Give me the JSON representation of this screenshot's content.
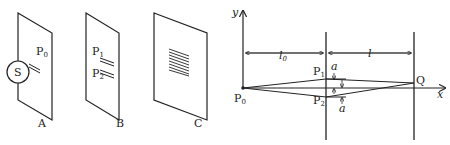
{
  "left_figure": {
    "screens": [
      {
        "id": "A",
        "label": "A",
        "slits": [
          {
            "label": "P",
            "sub": "0"
          }
        ],
        "source": "S"
      },
      {
        "id": "B",
        "label": "B",
        "slits": [
          {
            "label": "P",
            "sub": "1"
          },
          {
            "label": "P",
            "sub": "2"
          }
        ]
      },
      {
        "id": "C",
        "label": "C",
        "pattern": "interference fringes"
      }
    ]
  },
  "right_figure": {
    "axes": {
      "y": "y",
      "x": "x"
    },
    "points": {
      "origin": "P",
      "origin_sub": "0",
      "p1": "P",
      "p1_sub": "1",
      "p2": "P",
      "p2_sub": "2",
      "q": "Q"
    },
    "distances": {
      "l0": "l",
      "l0_sub": "0",
      "l": "l"
    },
    "offsets": {
      "a_top": "a",
      "a_bottom": "a"
    }
  }
}
